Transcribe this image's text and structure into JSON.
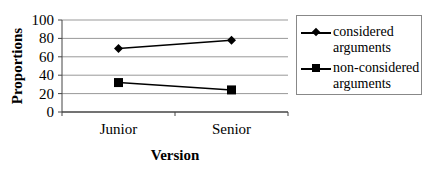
{
  "chart_data": {
    "type": "line",
    "title": "",
    "xlabel": "Version",
    "ylabel": "Proportions",
    "categories": [
      "Junior",
      "Senior"
    ],
    "series": [
      {
        "name": "considered arguments",
        "marker": "diamond",
        "values": [
          69,
          78
        ]
      },
      {
        "name": "non-considered arguments",
        "marker": "square",
        "values": [
          32,
          24
        ]
      }
    ],
    "ylim": [
      0,
      100
    ],
    "yticks": [
      "0",
      "20",
      "40",
      "60",
      "80",
      "100"
    ],
    "grid": true,
    "legend_position": "right"
  },
  "legend": {
    "item1_line1": "considered",
    "item1_line2": "arguments",
    "item2_line1": "non-considered",
    "item2_line2": "arguments"
  }
}
